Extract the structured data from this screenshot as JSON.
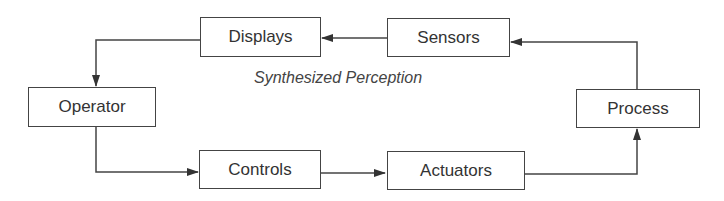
{
  "diagram": {
    "caption": "Synthesized Perception",
    "nodes": [
      {
        "id": "displays",
        "label": "Displays"
      },
      {
        "id": "sensors",
        "label": "Sensors"
      },
      {
        "id": "operator",
        "label": "Operator"
      },
      {
        "id": "process",
        "label": "Process"
      },
      {
        "id": "controls",
        "label": "Controls"
      },
      {
        "id": "actuators",
        "label": "Actuators"
      }
    ],
    "edges": [
      {
        "from": "sensors",
        "to": "displays"
      },
      {
        "from": "displays",
        "to": "operator"
      },
      {
        "from": "operator",
        "to": "controls"
      },
      {
        "from": "controls",
        "to": "actuators"
      },
      {
        "from": "actuators",
        "to": "process"
      },
      {
        "from": "process",
        "to": "sensors"
      }
    ],
    "colors": {
      "line": "#444444",
      "text": "#333333",
      "background": "#ffffff"
    }
  }
}
